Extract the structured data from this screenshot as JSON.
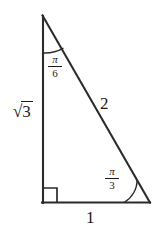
{
  "figure": {
    "name": "right-triangle-30-60-90",
    "background_color": "#ffffff",
    "stroke_color": "#2b2b2b",
    "text_color": "#1b1b1b",
    "vertices": {
      "apex": [
        42,
        15
      ],
      "bottom_left": [
        42,
        203
      ],
      "bottom_right": [
        150,
        203
      ]
    },
    "right_angle_marker": {
      "at": "bottom_left",
      "size": 14
    },
    "sides": [
      {
        "name": "vertical-leg",
        "label": "√3",
        "radical_radicand": "3",
        "position": [
          13,
          101
        ]
      },
      {
        "name": "hypotenuse",
        "label": "2",
        "position": [
          100,
          95
        ]
      },
      {
        "name": "base-leg",
        "label": "1",
        "position": [
          86,
          209
        ]
      }
    ],
    "angles": [
      {
        "name": "top-angle",
        "numerator": "π",
        "denominator": "6",
        "label": "π/6",
        "position": [
          48,
          54
        ],
        "arc": {
          "cx": 42,
          "cy": 15,
          "r": 38
        }
      },
      {
        "name": "bottom-right-angle",
        "numerator": "π",
        "denominator": "3",
        "label": "π/3",
        "position": [
          105,
          166
        ],
        "arc": {
          "cx": 150,
          "cy": 203,
          "r": 26
        }
      }
    ]
  }
}
